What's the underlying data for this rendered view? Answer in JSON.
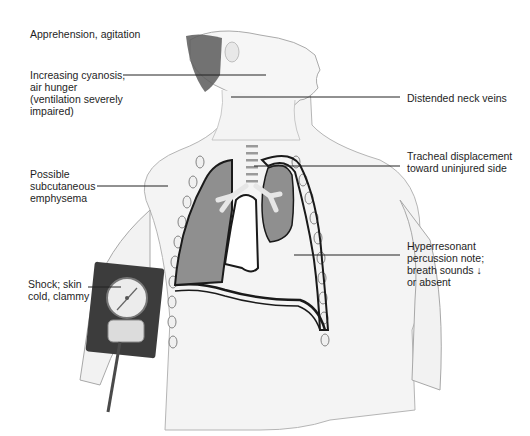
{
  "diagram": {
    "colors": {
      "background": "#ffffff",
      "skin": "#f4f4f4",
      "skin_outline": "#9a9a9a",
      "hair": "#5a5a5a",
      "lung": "#8f8f8f",
      "lung_outline": "#1a1a1a",
      "bronchi": "#e6e6e6",
      "cuff": "#3c3c3c",
      "gauge_face": "#ececec",
      "leader_line": "#222222",
      "text": "#1e1e1e"
    },
    "labels": [
      {
        "id": "apprehension",
        "text": "Apprehension, agitation"
      },
      {
        "id": "cyanosis",
        "text": "Increasing cyanosis,\nair hunger\n(ventilation severely\nimpaired)"
      },
      {
        "id": "emphysema",
        "text": "Possible\nsubcutaneous\nemphysema"
      },
      {
        "id": "shock",
        "text": "Shock; skin\ncold, clammy"
      },
      {
        "id": "neck_veins",
        "text": "Distended neck veins"
      },
      {
        "id": "tracheal",
        "text": "Tracheal displacement\ntoward uninjured side"
      },
      {
        "id": "hyperresonant",
        "text": "Hyperresonant\npercussion note;\nbreath sounds ↓\nor absent"
      }
    ]
  }
}
